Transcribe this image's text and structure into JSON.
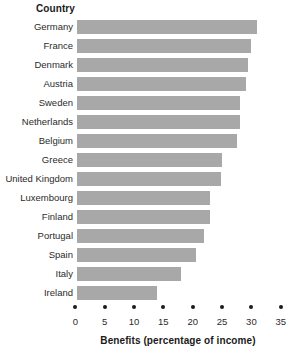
{
  "chart_data": {
    "type": "bar",
    "orientation": "horizontal",
    "title": "",
    "xlabel": "Benefits (percentage of income)",
    "ylabel": "Country",
    "categories": [
      "Germany",
      "France",
      "Denmark",
      "Austria",
      "Sweden",
      "Netherlands",
      "Belgium",
      "Greece",
      "United Kingdom",
      "Luxembourg",
      "Finland",
      "Portugal",
      "Spain",
      "Italy",
      "Ireland"
    ],
    "values": [
      31,
      30,
      29.5,
      29,
      28,
      28,
      27.5,
      25,
      24.8,
      23,
      23,
      22,
      20.5,
      18,
      14
    ],
    "xlim": [
      0,
      35
    ],
    "xticks": [
      0,
      5,
      10,
      15,
      20,
      25,
      30,
      35
    ],
    "xtick_labels": [
      "0",
      "5",
      "10",
      "15",
      "20",
      "25",
      "30",
      "35"
    ],
    "grid": false,
    "legend": false,
    "bar_color": "#a8a8a8",
    "text_color": "#2b2b2b",
    "background": "#ffffff"
  }
}
